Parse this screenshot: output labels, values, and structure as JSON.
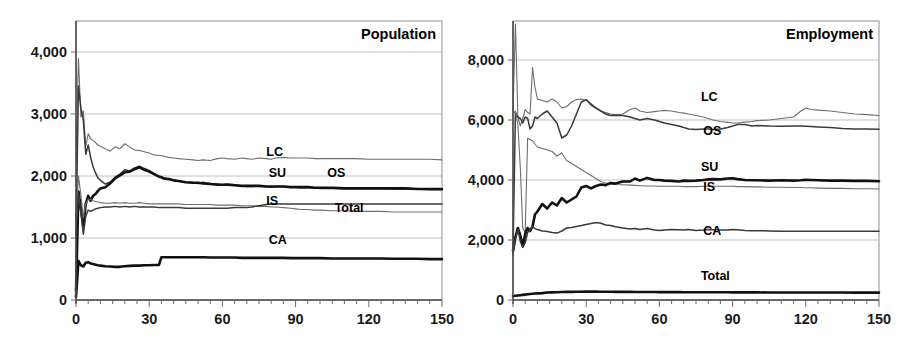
{
  "figure": {
    "panels": [
      {
        "id": "population",
        "title": "Population",
        "xlabel": "",
        "ylabel": "",
        "xticks": [
          "0",
          "30",
          "60",
          "90",
          "120",
          "150"
        ],
        "yticks": [
          "0",
          "1,000",
          "2,000",
          "3,000",
          "4,000"
        ],
        "labels": [
          {
            "text": "LC",
            "x": 78,
            "y": 2330
          },
          {
            "text": "SU",
            "x": 79,
            "y": 1990
          },
          {
            "text": "OS",
            "x": 103,
            "y": 1990
          },
          {
            "text": "IS",
            "x": 78,
            "y": 1530
          },
          {
            "text": "Total",
            "x": 106,
            "y": 1420
          },
          {
            "text": "CA",
            "x": 79,
            "y": 900
          }
        ]
      },
      {
        "id": "employment",
        "title": "Employment",
        "xlabel": "",
        "ylabel": "",
        "xticks": [
          "0",
          "30",
          "60",
          "90",
          "120",
          "150"
        ],
        "yticks": [
          "0",
          "2,000",
          "4,000",
          "6,000",
          "8,000"
        ],
        "labels": [
          {
            "text": "LC",
            "x": 77,
            "y": 6620
          },
          {
            "text": "OS",
            "x": 78,
            "y": 5500
          },
          {
            "text": "SU",
            "x": 77,
            "y": 4300
          },
          {
            "text": "IS",
            "x": 78,
            "y": 3640
          },
          {
            "text": "CA",
            "x": 78,
            "y": 2180
          },
          {
            "text": "Total",
            "x": 77,
            "y": 680
          }
        ]
      }
    ]
  },
  "colors": {
    "heavy": "#111111",
    "medium": "#3a3a3a",
    "light": "#6e6e6e",
    "grid": "#b9b9b9",
    "frame": "#9a9a9a",
    "text": "#111111",
    "background": "#ffffff"
  },
  "chart_data": [
    {
      "type": "line",
      "title": "Population",
      "xlabel": "",
      "ylabel": "",
      "xlim": [
        0,
        150
      ],
      "ylim": [
        0,
        4500
      ],
      "yticks": [
        0,
        1000,
        2000,
        3000,
        4000
      ],
      "xticks": [
        0,
        30,
        60,
        90,
        120,
        150
      ],
      "grid": true,
      "legend": "inline-annotations",
      "x": [
        0,
        1,
        2,
        3,
        4,
        5,
        6,
        7,
        8,
        9,
        10,
        12,
        14,
        16,
        18,
        20,
        22,
        24,
        26,
        28,
        30,
        32,
        34,
        35,
        36,
        38,
        40,
        42,
        45,
        48,
        50,
        52,
        55,
        58,
        60,
        62,
        65,
        68,
        70,
        72,
        75,
        78,
        80,
        82,
        85,
        88,
        90,
        92,
        95,
        98,
        100,
        105,
        110,
        115,
        120,
        125,
        130,
        135,
        140,
        145,
        150
      ],
      "series": [
        {
          "name": "LC",
          "weight": "light",
          "values": [
            2300,
            3900,
            2950,
            3050,
            2480,
            2680,
            2600,
            2570,
            2540,
            2500,
            2480,
            2440,
            2400,
            2470,
            2440,
            2520,
            2470,
            2420,
            2410,
            2390,
            2370,
            2340,
            2330,
            2330,
            2320,
            2300,
            2290,
            2280,
            2270,
            2260,
            2250,
            2260,
            2250,
            2280,
            2290,
            2280,
            2270,
            2290,
            2280,
            2270,
            2290,
            2280,
            2270,
            2290,
            2300,
            2290,
            2290,
            2290,
            2290,
            2280,
            2280,
            2280,
            2280,
            2280,
            2270,
            2270,
            2270,
            2270,
            2270,
            2270,
            2260
          ]
        },
        {
          "name": "OS",
          "weight": "medium",
          "values": [
            1000,
            3450,
            3100,
            2900,
            2350,
            2500,
            2300,
            2150,
            2050,
            1970,
            1930,
            1870,
            1900,
            1980,
            2030,
            2100,
            2080,
            2130,
            2160,
            2120,
            2090,
            2040,
            1990,
            1980,
            1970,
            1950,
            1930,
            1920,
            1900,
            1890,
            1880,
            1900,
            1880,
            1870,
            1860,
            1870,
            1860,
            1840,
            1830,
            1830,
            1840,
            1830,
            1820,
            1830,
            1830,
            1820,
            1820,
            1810,
            1810,
            1810,
            1800,
            1800,
            1800,
            1800,
            1800,
            1800,
            1790,
            1790,
            1790,
            1780,
            1780
          ]
        },
        {
          "name": "SU",
          "weight": "heavy",
          "values": [
            150,
            1750,
            1480,
            1200,
            1550,
            1680,
            1600,
            1680,
            1710,
            1760,
            1800,
            1820,
            1880,
            1960,
            2010,
            2060,
            2070,
            2110,
            2140,
            2100,
            2070,
            2030,
            1990,
            1980,
            1960,
            1950,
            1930,
            1920,
            1900,
            1890,
            1890,
            1880,
            1870,
            1860,
            1860,
            1860,
            1850,
            1840,
            1840,
            1840,
            1840,
            1830,
            1830,
            1830,
            1830,
            1820,
            1820,
            1820,
            1820,
            1810,
            1810,
            1810,
            1800,
            1800,
            1800,
            1800,
            1800,
            1800,
            1790,
            1790,
            1790
          ]
        },
        {
          "name": "IS",
          "weight": "light",
          "values": [
            1200,
            2000,
            1700,
            1320,
            1550,
            1630,
            1620,
            1600,
            1590,
            1580,
            1570,
            1560,
            1560,
            1570,
            1560,
            1570,
            1560,
            1560,
            1570,
            1560,
            1550,
            1550,
            1550,
            1550,
            1550,
            1550,
            1550,
            1550,
            1540,
            1540,
            1540,
            1540,
            1540,
            1530,
            1530,
            1530,
            1530,
            1520,
            1520,
            1520,
            1510,
            1510,
            1500,
            1500,
            1490,
            1480,
            1470,
            1460,
            1460,
            1450,
            1450,
            1440,
            1440,
            1430,
            1430,
            1430,
            1420,
            1420,
            1420,
            1420,
            1420
          ]
        },
        {
          "name": "Total",
          "weight": "medium",
          "values": [
            1100,
            1720,
            1400,
            1060,
            1350,
            1450,
            1430,
            1450,
            1470,
            1480,
            1490,
            1500,
            1500,
            1510,
            1500,
            1510,
            1500,
            1510,
            1500,
            1500,
            1500,
            1500,
            1490,
            1490,
            1490,
            1490,
            1490,
            1490,
            1480,
            1480,
            1480,
            1480,
            1480,
            1480,
            1480,
            1480,
            1490,
            1490,
            1490,
            1500,
            1520,
            1540,
            1550,
            1550,
            1550,
            1550,
            1550,
            1550,
            1550,
            1550,
            1550,
            1550,
            1550,
            1550,
            1550,
            1550,
            1550,
            1550,
            1550,
            1550,
            1550
          ]
        },
        {
          "name": "CA",
          "weight": "heavy",
          "values": [
            50,
            630,
            560,
            540,
            600,
            610,
            590,
            580,
            570,
            560,
            555,
            545,
            540,
            535,
            535,
            545,
            550,
            555,
            555,
            560,
            560,
            565,
            565,
            690,
            690,
            690,
            690,
            690,
            690,
            690,
            690,
            690,
            685,
            685,
            685,
            685,
            685,
            680,
            680,
            680,
            680,
            680,
            680,
            680,
            680,
            675,
            675,
            675,
            675,
            675,
            675,
            670,
            670,
            670,
            670,
            670,
            665,
            665,
            665,
            660,
            660
          ]
        }
      ]
    },
    {
      "type": "line",
      "title": "Employment",
      "xlabel": "",
      "ylabel": "",
      "xlim": [
        0,
        150
      ],
      "ylim": [
        0,
        9300
      ],
      "yticks": [
        0,
        2000,
        4000,
        6000,
        8000
      ],
      "xticks": [
        0,
        30,
        60,
        90,
        120,
        150
      ],
      "grid": true,
      "legend": "inline-annotations",
      "x": [
        0,
        1,
        2,
        3,
        4,
        5,
        6,
        7,
        8,
        9,
        10,
        12,
        14,
        16,
        18,
        20,
        22,
        24,
        26,
        28,
        30,
        32,
        34,
        36,
        38,
        40,
        42,
        45,
        48,
        50,
        52,
        55,
        58,
        60,
        62,
        65,
        68,
        70,
        72,
        75,
        78,
        80,
        82,
        85,
        88,
        90,
        92,
        95,
        98,
        100,
        105,
        110,
        115,
        118,
        120,
        122,
        125,
        130,
        135,
        140,
        145,
        150
      ],
      "series": [
        {
          "name": "LC",
          "weight": "light",
          "values": [
            6300,
            9200,
            6100,
            5800,
            6050,
            6350,
            6250,
            6200,
            7750,
            7100,
            6700,
            6650,
            6600,
            6700,
            6600,
            6400,
            6450,
            6600,
            6680,
            6700,
            6650,
            6550,
            6400,
            6300,
            6250,
            6200,
            6180,
            6200,
            6350,
            6400,
            6300,
            6250,
            6280,
            6300,
            6320,
            6300,
            6250,
            6230,
            6200,
            6150,
            6100,
            6050,
            6000,
            5950,
            5920,
            5900,
            5900,
            5930,
            5950,
            5980,
            6000,
            6050,
            6100,
            6300,
            6400,
            6350,
            6330,
            6300,
            6250,
            6200,
            6180,
            6150
          ]
        },
        {
          "name": "OS",
          "weight": "medium",
          "values": [
            1600,
            6250,
            6100,
            6050,
            5900,
            6100,
            6050,
            5700,
            5800,
            6100,
            6050,
            6200,
            6300,
            6100,
            5900,
            5400,
            5500,
            5800,
            6200,
            6600,
            6680,
            6500,
            6400,
            6300,
            6200,
            6150,
            6150,
            6150,
            6100,
            6050,
            6000,
            6050,
            6000,
            5950,
            5900,
            5850,
            5800,
            5750,
            5700,
            5680,
            5700,
            5700,
            5680,
            5700,
            5750,
            5800,
            5850,
            5850,
            5800,
            5820,
            5800,
            5790,
            5800,
            5800,
            5790,
            5780,
            5770,
            5750,
            5720,
            5700,
            5700,
            5690
          ]
        },
        {
          "name": "IS",
          "weight": "light",
          "values": [
            6200,
            6300,
            5850,
            4400,
            2400,
            2250,
            5400,
            5350,
            5300,
            5200,
            5100,
            5050,
            5000,
            4950,
            4800,
            4900,
            4650,
            4550,
            4450,
            4350,
            4250,
            4150,
            4050,
            3950,
            3900,
            3870,
            3850,
            3840,
            3830,
            3820,
            3810,
            3800,
            3800,
            3790,
            3790,
            3790,
            3790,
            3780,
            3780,
            3780,
            3790,
            3790,
            3790,
            3790,
            3790,
            3790,
            3780,
            3780,
            3770,
            3770,
            3760,
            3760,
            3750,
            3750,
            3740,
            3740,
            3730,
            3720,
            3720,
            3710,
            3710,
            3700
          ]
        },
        {
          "name": "SU",
          "weight": "heavy",
          "values": [
            1650,
            2100,
            2400,
            2150,
            1800,
            2200,
            2400,
            2300,
            2450,
            2850,
            2950,
            3200,
            3050,
            3250,
            3150,
            3400,
            3250,
            3350,
            3450,
            3750,
            3800,
            3720,
            3800,
            3850,
            3830,
            3900,
            3880,
            3950,
            3950,
            4050,
            3980,
            4070,
            4000,
            4000,
            3980,
            3970,
            3950,
            3980,
            3970,
            3980,
            4000,
            4020,
            4030,
            4020,
            4050,
            4060,
            4030,
            4000,
            3990,
            3990,
            3980,
            3990,
            3980,
            3990,
            4010,
            4000,
            3990,
            3980,
            3980,
            3970,
            3970,
            3960
          ]
        },
        {
          "name": "CA",
          "weight": "medium",
          "values": [
            1500,
            2050,
            2350,
            1950,
            1750,
            1900,
            2250,
            2350,
            2450,
            2380,
            2350,
            2300,
            2280,
            2250,
            2230,
            2300,
            2400,
            2420,
            2450,
            2480,
            2520,
            2550,
            2580,
            2560,
            2500,
            2480,
            2440,
            2400,
            2370,
            2380,
            2350,
            2380,
            2330,
            2320,
            2330,
            2350,
            2340,
            2330,
            2350,
            2320,
            2330,
            2350,
            2340,
            2330,
            2330,
            2350,
            2340,
            2320,
            2310,
            2310,
            2300,
            2290,
            2290,
            2290,
            2290,
            2290,
            2290,
            2290,
            2290,
            2290,
            2290,
            2290
          ]
        },
        {
          "name": "Total",
          "weight": "heavy",
          "values": [
            130,
            140,
            150,
            160,
            170,
            180,
            190,
            200,
            210,
            215,
            220,
            230,
            250,
            255,
            260,
            265,
            270,
            272,
            275,
            276,
            278,
            280,
            278,
            276,
            275,
            274,
            272,
            270,
            270,
            268,
            268,
            266,
            265,
            264,
            263,
            262,
            262,
            260,
            260,
            259,
            258,
            258,
            257,
            256,
            256,
            255,
            255,
            254,
            254,
            253,
            252,
            251,
            250,
            250,
            250,
            249,
            249,
            248,
            248,
            247,
            247,
            246
          ]
        }
      ]
    }
  ]
}
